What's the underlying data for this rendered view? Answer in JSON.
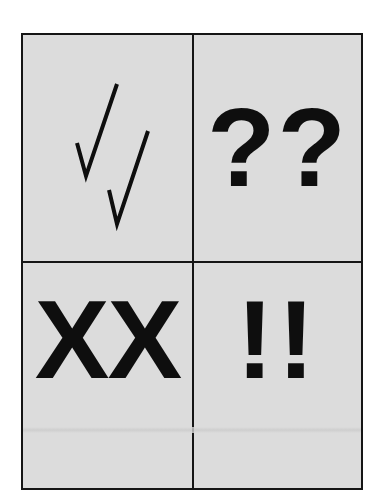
{
  "cells": {
    "top_left": {
      "symbol": "√√",
      "icon": "double-check-icon",
      "meaning": "correct"
    },
    "top_right": {
      "symbol": "??",
      "icon": "double-question-icon"
    },
    "bottom_left": {
      "symbol": "XX",
      "icon": "double-x-icon"
    },
    "bottom_right": {
      "symbol": "!!",
      "icon": "double-exclamation-icon"
    }
  },
  "colors": {
    "cell_background": "#dcdcdc",
    "border": "#151515",
    "symbol": "#0e0e0e"
  }
}
